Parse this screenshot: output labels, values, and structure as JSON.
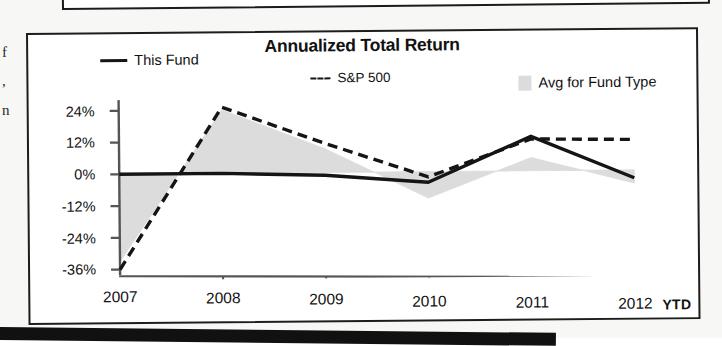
{
  "chart_data": {
    "type": "line",
    "title": "Annualized Total Return",
    "xlabel": "",
    "ylabel": "",
    "grid": false,
    "legend_position": "top",
    "categories": [
      "2007",
      "2008",
      "2009",
      "2010",
      "2011",
      "2012"
    ],
    "last_period_note": "YTD",
    "ylim": [
      -40,
      28
    ],
    "yticks": [
      24,
      12,
      0,
      -12,
      -24,
      -36
    ],
    "ytick_labels": [
      "24%",
      "12%",
      "0%",
      "-12%",
      "-24%",
      "-36%"
    ],
    "series": [
      {
        "name": "This Fund",
        "style": "solid-line",
        "color": "#151515",
        "values": [
          0,
          0,
          -1,
          -4,
          13,
          -3
        ]
      },
      {
        "name": "S&P 500",
        "style": "dashed-line",
        "color": "#151515",
        "values": [
          -36,
          25,
          11,
          -2,
          12,
          11.5
        ]
      },
      {
        "name": "Avg for Fund Type",
        "style": "filled-area",
        "color": "#dcdcdc",
        "values": [
          -33,
          24,
          9,
          -10,
          5,
          -5
        ]
      }
    ]
  },
  "chart": {
    "title": "Annualized Total Return",
    "legend": [
      {
        "label": "This Fund",
        "marker": "solid-line-swatch"
      },
      {
        "label": "S&P 500",
        "marker": "dashed-line-swatch"
      },
      {
        "label": "Avg for Fund Type",
        "marker": "gray-area-swatch"
      }
    ],
    "y_axis": {
      "labels": [
        "24%",
        "12%",
        "0%",
        "-12%",
        "-24%",
        "-36%"
      ]
    },
    "x_axis": {
      "labels": [
        "2007",
        "2008",
        "2009",
        "2010",
        "2011",
        "2012"
      ],
      "suffix_label": "YTD"
    },
    "colors": {
      "line": "#151515",
      "area_fill": "#dcdcdc",
      "axis": "#555555",
      "frame": "#1d1d1d"
    }
  },
  "scan_artifacts": {
    "gutter_fragments": [
      "f",
      ",",
      "n"
    ]
  }
}
